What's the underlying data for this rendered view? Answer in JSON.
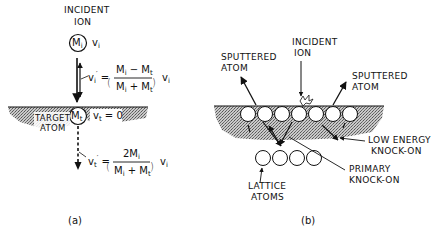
{
  "panel_a": {
    "incident_label_1": "INCIDENT",
    "incident_label_2": "ION",
    "ion_mass": "M",
    "ion_mass_sub": "i",
    "ion_velocity": "v",
    "ion_velocity_sub": "i",
    "reflected_velocity": "v",
    "reflected_velocity_sub": "i",
    "reflected_eq_num": "M − M",
    "reflected_eq_num_sub1": "i",
    "reflected_eq_num_sub2": "t",
    "reflected_eq_den": "M + M",
    "reflected_eq_den_sub1": "i",
    "reflected_eq_den_sub2": "t",
    "target_mass": "M",
    "target_mass_sub": "t",
    "target_velocity": "v",
    "target_velocity_sub": "t",
    "target_velocity_value": "= 0",
    "target_label_1": "TARGET",
    "target_label_2": "ATOM",
    "recoil_velocity": "v",
    "recoil_velocity_sub": "t",
    "recoil_eq_num": "2M",
    "recoil_eq_num_sub": "i",
    "recoil_eq_den": "M + M",
    "recoil_eq_den_sub1": "i",
    "recoil_eq_den_sub2": "t",
    "trailing_v": "v",
    "trailing_v_sub": "i",
    "caption": "(a)"
  },
  "panel_b": {
    "incident_label_1": "INCIDENT",
    "incident_label_2": "ION",
    "sputtered_left_1": "SPUTTERED",
    "sputtered_left_2": "ATOM",
    "sputtered_right_1": "SPUTTERED",
    "sputtered_right_2": "ATOM",
    "low_energy_1": "LOW ENERGY",
    "low_energy_2": "KNOCK-ON",
    "primary_1": "PRIMARY",
    "primary_2": "KNOCK-ON",
    "lattice_1": "LATTICE",
    "lattice_2": "ATOMS",
    "surface_atom_count": 7,
    "lattice_atom_count": 4,
    "caption": "(b)"
  },
  "colors": {
    "ink": "#111111",
    "shading": "#9a9a9a",
    "background": "#ffffff"
  }
}
